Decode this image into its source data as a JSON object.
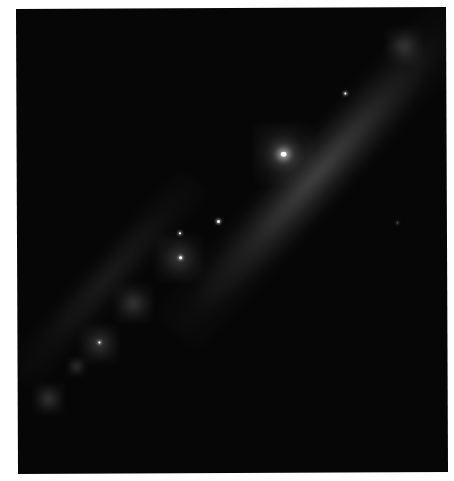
{
  "image": {
    "subject": "edge-on spiral galaxy",
    "background_color": "#060606",
    "border_color": "#ffffff",
    "disk_angle_deg": -48,
    "core": {
      "x": 284,
      "y": 154
    },
    "bright_points": [
      {
        "x": 284,
        "y": 154,
        "size": 5,
        "kind": "core"
      },
      {
        "x": 346,
        "y": 93,
        "size": 2
      },
      {
        "x": 218,
        "y": 221,
        "size": 3
      },
      {
        "x": 180,
        "y": 257,
        "size": 3
      },
      {
        "x": 180,
        "y": 232,
        "size": 2
      },
      {
        "x": 99,
        "y": 342,
        "size": 2
      }
    ],
    "diffuse_knots": [
      {
        "x": 403,
        "y": 44,
        "r": 16
      },
      {
        "x": 180,
        "y": 257,
        "r": 22
      },
      {
        "x": 132,
        "y": 302,
        "r": 18
      },
      {
        "x": 99,
        "y": 342,
        "r": 18
      },
      {
        "x": 75,
        "y": 365,
        "r": 8
      },
      {
        "x": 47,
        "y": 395,
        "r": 14
      }
    ]
  }
}
